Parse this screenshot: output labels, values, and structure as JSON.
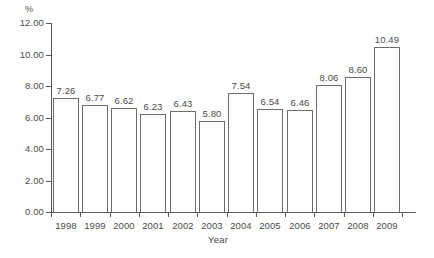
{
  "chart_data": {
    "type": "bar",
    "title": "",
    "subtitle": "",
    "xlabel": "Year",
    "ylabel": "%",
    "ylim": [
      0,
      12
    ],
    "ytick_labels": [
      "12.00",
      "10.00",
      "8.00",
      "6.00",
      "4.00",
      "2.00",
      "0.00"
    ],
    "ytick_values": [
      12,
      10,
      8,
      6,
      4,
      2,
      0
    ],
    "grid": false,
    "legend": false,
    "categories": [
      "1998",
      "1999",
      "2000",
      "2001",
      "2002",
      "2003",
      "2004",
      "2005",
      "2006",
      "2007",
      "2008",
      "2009"
    ],
    "values": [
      7.26,
      6.77,
      6.62,
      6.23,
      6.43,
      5.8,
      7.54,
      6.54,
      6.46,
      8.06,
      8.6,
      10.49
    ],
    "value_labels": [
      "7.26",
      "6.77",
      "6.62",
      "6.23",
      "6.43",
      "5.80",
      "7.54",
      "6.54",
      "6.46",
      "8.06",
      "8.60",
      "10.49"
    ],
    "bar_fill_color": "#ffffff",
    "bar_edge_color": "#6d6d6d",
    "axis_color": "#5a5a5a",
    "text_color": "#4a4a4a",
    "background_color": "#ffffff"
  },
  "axes": {
    "y_unit_label": "%",
    "x_title": "Year"
  }
}
